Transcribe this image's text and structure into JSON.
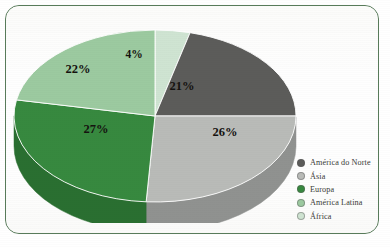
{
  "frame": {
    "border_color": "#587b5a",
    "background": "#ffffff"
  },
  "chart_data": {
    "type": "pie",
    "title": "",
    "subtitle": "",
    "xlabel": "",
    "ylabel": "",
    "legend_position": "right",
    "three_d": true,
    "start_angle_deg": 0,
    "direction": "clockwise",
    "categories": [
      "África",
      "América do Norte",
      "Ásia",
      "Europa",
      "América Latina"
    ],
    "values": [
      4,
      21,
      26,
      27,
      22
    ],
    "value_unit": "%",
    "data_labels": [
      "4%",
      "21%",
      "26%",
      "27%",
      "22%"
    ],
    "colors": [
      "#cfe4d2",
      "#5c5c5a",
      "#b9bbb8",
      "#37893f",
      "#9ccaa0"
    ],
    "side_colors": [
      "#a9c6ad",
      "#474745",
      "#909290",
      "#2a6f31",
      "#7aae80"
    ],
    "slices": [
      {
        "label": "África",
        "value": 4,
        "data_label": "4%",
        "color": "#cfe4d2",
        "side_color": "#a9c6ad"
      },
      {
        "label": "América do Norte",
        "value": 21,
        "data_label": "21%",
        "color": "#5c5c5a",
        "side_color": "#474745"
      },
      {
        "label": "Ásia",
        "value": 26,
        "data_label": "26%",
        "color": "#b9bbb8",
        "side_color": "#909290"
      },
      {
        "label": "Europa",
        "value": 27,
        "data_label": "27%",
        "color": "#37893f",
        "side_color": "#2a6f31"
      },
      {
        "label": "América Latina",
        "value": 22,
        "data_label": "22%",
        "color": "#9ccaa0",
        "side_color": "#7aae80"
      }
    ]
  },
  "labels": {
    "africa": "4%",
    "america_do_norte": "21%",
    "asia": "26%",
    "europa": "27%",
    "america_latina": "22%"
  },
  "legend": {
    "items": [
      {
        "label": "América do Norte",
        "color": "#5c5c5a"
      },
      {
        "label": "Ásia",
        "color": "#b9bbb8"
      },
      {
        "label": "Europa",
        "color": "#37893f"
      },
      {
        "label": "América Latina",
        "color": "#9ccaa0"
      },
      {
        "label": "África",
        "color": "#cfe4d2"
      }
    ]
  }
}
